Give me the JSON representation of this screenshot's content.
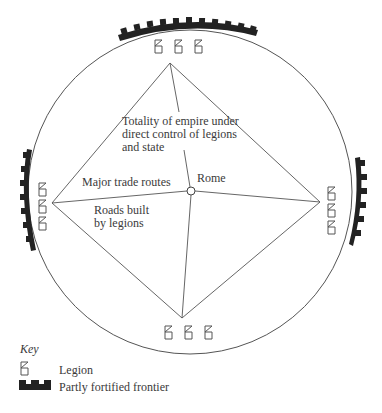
{
  "diagram": {
    "labels": {
      "empire": [
        "Totality of empire under",
        "direct control of legions",
        "and state"
      ],
      "trade_routes": "Major trade routes",
      "roads": [
        "Roads built",
        "by legions"
      ],
      "rome": "Rome"
    },
    "nodes": {
      "rome": {
        "x": 191,
        "y": 191
      },
      "north": {
        "x": 170,
        "y": 63
      },
      "west": {
        "x": 52,
        "y": 203
      },
      "east": {
        "x": 320,
        "y": 202
      },
      "south": {
        "x": 182,
        "y": 318
      }
    },
    "legion_groups": [
      "north",
      "west",
      "east",
      "south"
    ],
    "fortified_frontiers": [
      "north",
      "west",
      "east"
    ]
  },
  "key": {
    "title": "Key",
    "items": [
      {
        "icon": "legion-icon",
        "label": "Legion"
      },
      {
        "icon": "fortified-frontier-icon",
        "label": "Partly fortified frontier"
      }
    ]
  },
  "colors": {
    "line": "#555555",
    "fortification": "#222222",
    "text": "#3a3a3a"
  }
}
